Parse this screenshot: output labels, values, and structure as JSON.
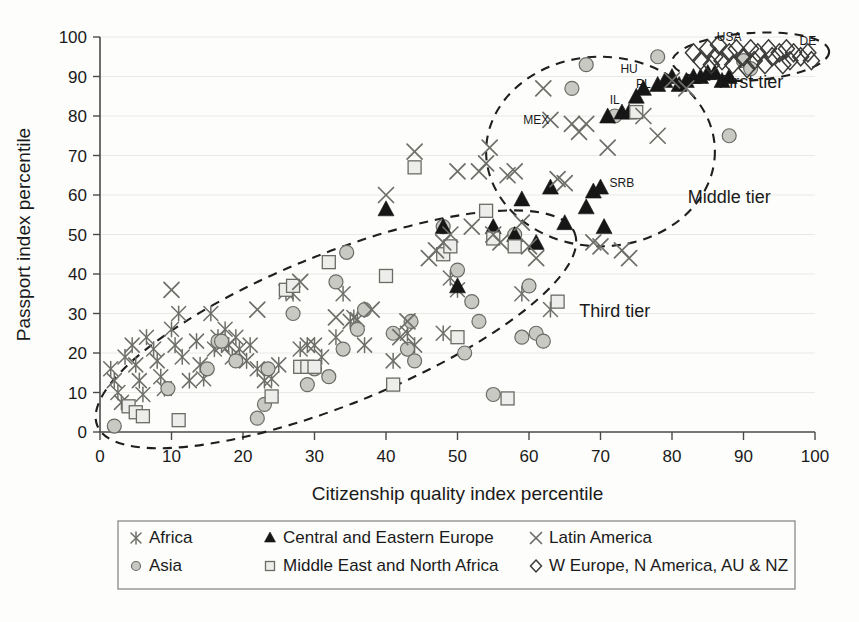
{
  "chart_data": {
    "type": "scatter",
    "title": "",
    "xlabel": "Citizenship quality index percentile",
    "ylabel": "Passport index percentile",
    "xlim": [
      0,
      100
    ],
    "ylim": [
      0,
      100
    ],
    "xticks": [
      0,
      10,
      20,
      30,
      40,
      50,
      60,
      70,
      80,
      90,
      100
    ],
    "yticks": [
      0,
      10,
      20,
      30,
      40,
      50,
      60,
      70,
      80,
      90,
      100
    ],
    "grid": "horizontal",
    "legend_position": "below-plot",
    "series": [
      {
        "name": "Africa",
        "marker": "asterisk",
        "color": "#6e6e6a",
        "points": [
          [
            1.5,
            16
          ],
          [
            2,
            13
          ],
          [
            2.5,
            10
          ],
          [
            3,
            7.5
          ],
          [
            3.5,
            19
          ],
          [
            4.5,
            22
          ],
          [
            5,
            17
          ],
          [
            5.5,
            13
          ],
          [
            6,
            9.5
          ],
          [
            6.5,
            24
          ],
          [
            7.5,
            21
          ],
          [
            8,
            18
          ],
          [
            8.5,
            14
          ],
          [
            9,
            11
          ],
          [
            10,
            26
          ],
          [
            10.5,
            22
          ],
          [
            11,
            30
          ],
          [
            11.5,
            19
          ],
          [
            12.5,
            13
          ],
          [
            13.5,
            23
          ],
          [
            14,
            17
          ],
          [
            14.5,
            13.5
          ],
          [
            15.5,
            30
          ],
          [
            16,
            21
          ],
          [
            16.5,
            24
          ],
          [
            17,
            22
          ],
          [
            17.5,
            26
          ],
          [
            18,
            22
          ],
          [
            18.5,
            19
          ],
          [
            19,
            24
          ],
          [
            19.5,
            21
          ],
          [
            20.5,
            18
          ],
          [
            21,
            22
          ],
          [
            22,
            16
          ],
          [
            23,
            13
          ],
          [
            24,
            13.5
          ],
          [
            25,
            17
          ],
          [
            26,
            35.5
          ],
          [
            27,
            35
          ],
          [
            28,
            21
          ],
          [
            29,
            22
          ],
          [
            30,
            22
          ],
          [
            31,
            19
          ],
          [
            33,
            24
          ],
          [
            34,
            35
          ],
          [
            35,
            28
          ],
          [
            35.5,
            29
          ],
          [
            36,
            28.5
          ],
          [
            37,
            22
          ],
          [
            41,
            18
          ],
          [
            43,
            25
          ],
          [
            44,
            22
          ],
          [
            48,
            25
          ],
          [
            49,
            39
          ],
          [
            50,
            36
          ],
          [
            59,
            35
          ],
          [
            63,
            31
          ]
        ]
      },
      {
        "name": "Asia",
        "marker": "circle",
        "color": "#c9c9c4",
        "points": [
          [
            2,
            1.5
          ],
          [
            9.5,
            11
          ],
          [
            15,
            16
          ],
          [
            16.5,
            23
          ],
          [
            17,
            23
          ],
          [
            19,
            18
          ],
          [
            22,
            3.5
          ],
          [
            23,
            7
          ],
          [
            23.5,
            16
          ],
          [
            27,
            30
          ],
          [
            29,
            12
          ],
          [
            30,
            16
          ],
          [
            32,
            14
          ],
          [
            33,
            38
          ],
          [
            34,
            21
          ],
          [
            34.5,
            45.5
          ],
          [
            36,
            26
          ],
          [
            37,
            31
          ],
          [
            41,
            25
          ],
          [
            43,
            21
          ],
          [
            43.5,
            28
          ],
          [
            44,
            18
          ],
          [
            48,
            52
          ],
          [
            50,
            41
          ],
          [
            51,
            20
          ],
          [
            52,
            33
          ],
          [
            53,
            28
          ],
          [
            55,
            9.5
          ],
          [
            58,
            50
          ],
          [
            59,
            24
          ],
          [
            60,
            37
          ],
          [
            61,
            25
          ],
          [
            62,
            23
          ],
          [
            66,
            87
          ],
          [
            68,
            93
          ],
          [
            72,
            80
          ],
          [
            78,
            95
          ],
          [
            88,
            75
          ],
          [
            90,
            94
          ],
          [
            91,
            92
          ]
        ]
      },
      {
        "name": "Central and Eastern Europe",
        "marker": "triangle",
        "color": "#161616",
        "points": [
          [
            40,
            56.5
          ],
          [
            48,
            52
          ],
          [
            50,
            37
          ],
          [
            55,
            52
          ],
          [
            58,
            50
          ],
          [
            59,
            59
          ],
          [
            61,
            48
          ],
          [
            63,
            62
          ],
          [
            65,
            53
          ],
          [
            68,
            57
          ],
          [
            69,
            61
          ],
          [
            70,
            62
          ],
          [
            70.5,
            52
          ],
          [
            71,
            80
          ],
          [
            73,
            81
          ],
          [
            74,
            81
          ],
          [
            75,
            85
          ],
          [
            76,
            87
          ],
          [
            78,
            88
          ],
          [
            79,
            89
          ],
          [
            80,
            90
          ],
          [
            81,
            88
          ],
          [
            82,
            89
          ],
          [
            83,
            90
          ],
          [
            84,
            90
          ],
          [
            85,
            91
          ],
          [
            86,
            91
          ],
          [
            87,
            89
          ],
          [
            88,
            90
          ]
        ]
      },
      {
        "name": "Middle East and North Africa",
        "marker": "square",
        "color": "#ededeb",
        "points": [
          [
            4,
            6.5
          ],
          [
            5,
            5
          ],
          [
            6,
            4
          ],
          [
            11,
            3
          ],
          [
            24,
            9
          ],
          [
            26,
            36
          ],
          [
            27,
            37
          ],
          [
            28,
            16.5
          ],
          [
            29,
            16.5
          ],
          [
            30,
            16.5
          ],
          [
            32,
            43
          ],
          [
            40,
            39.5
          ],
          [
            41,
            12
          ],
          [
            44,
            67
          ],
          [
            48,
            45
          ],
          [
            49,
            47
          ],
          [
            50,
            24
          ],
          [
            54,
            56
          ],
          [
            55,
            49
          ],
          [
            57,
            8.5
          ],
          [
            58,
            47
          ],
          [
            64,
            33
          ],
          [
            75,
            81
          ]
        ]
      },
      {
        "name": "Latin America",
        "marker": "x",
        "color": "#6e6e6a",
        "points": [
          [
            10,
            36
          ],
          [
            22,
            31
          ],
          [
            28,
            38
          ],
          [
            33,
            29
          ],
          [
            38,
            31
          ],
          [
            40,
            60
          ],
          [
            42,
            24
          ],
          [
            43,
            28
          ],
          [
            44,
            71
          ],
          [
            46,
            44
          ],
          [
            47,
            46
          ],
          [
            48,
            48
          ],
          [
            49,
            50
          ],
          [
            50,
            66
          ],
          [
            52,
            52
          ],
          [
            53,
            66
          ],
          [
            54,
            68
          ],
          [
            54.5,
            72
          ],
          [
            55,
            50
          ],
          [
            56,
            48
          ],
          [
            57,
            65
          ],
          [
            58,
            66
          ],
          [
            59,
            53
          ],
          [
            60,
            47
          ],
          [
            61,
            44
          ],
          [
            62,
            87
          ],
          [
            63,
            79
          ],
          [
            64,
            64
          ],
          [
            65,
            63
          ],
          [
            66,
            78
          ],
          [
            67,
            76
          ],
          [
            68,
            78
          ],
          [
            69,
            48
          ],
          [
            70,
            47
          ],
          [
            71,
            72
          ],
          [
            73,
            46
          ],
          [
            74,
            44
          ],
          [
            76,
            80
          ],
          [
            78,
            75
          ],
          [
            80,
            89
          ],
          [
            82,
            87
          ]
        ]
      },
      {
        "name": "W Europe, N America, AU & NZ",
        "marker": "diamond",
        "color": "#3a3a38",
        "points": [
          [
            83,
            96
          ],
          [
            84,
            94
          ],
          [
            85,
            97
          ],
          [
            85.5,
            93
          ],
          [
            86,
            95
          ],
          [
            86.5,
            98
          ],
          [
            87,
            94
          ],
          [
            88,
            96
          ],
          [
            88.5,
            93
          ],
          [
            89,
            97
          ],
          [
            90,
            95
          ],
          [
            90.5,
            92
          ],
          [
            91,
            97
          ],
          [
            91.5,
            94
          ],
          [
            92,
            96
          ],
          [
            93,
            93
          ],
          [
            93.5,
            97
          ],
          [
            94,
            95
          ],
          [
            95,
            96
          ],
          [
            95.5,
            93
          ],
          [
            96,
            97
          ],
          [
            96.5,
            94
          ],
          [
            97,
            96
          ],
          [
            98,
            95
          ],
          [
            99,
            96
          ],
          [
            99.5,
            94
          ]
        ]
      }
    ],
    "point_labels": [
      {
        "text": "USA",
        "x": 88,
        "y": 99
      },
      {
        "text": "DE",
        "x": 99,
        "y": 98
      },
      {
        "text": "HU",
        "x": 74,
        "y": 91
      },
      {
        "text": "PL",
        "x": 76,
        "y": 87
      },
      {
        "text": "IL",
        "x": 72,
        "y": 83
      },
      {
        "text": "MEX",
        "x": 61,
        "y": 78
      },
      {
        "text": "SRB",
        "x": 73,
        "y": 62
      }
    ],
    "annotations": [
      {
        "text": "First tier",
        "x": 91,
        "y": 87
      },
      {
        "text": "Middle tier",
        "x": 88,
        "y": 58
      },
      {
        "text": "Third tier",
        "x": 72,
        "y": 29
      }
    ],
    "clusters": [
      {
        "name": "first-tier-ellipse",
        "cx": 91,
        "cy": 95,
        "rx": 11,
        "ry": 6,
        "rotate": -4
      },
      {
        "name": "middle-tier-ellipse",
        "cx": 70,
        "cy": 71,
        "rx": 16,
        "ry": 24,
        "rotate": 0
      },
      {
        "name": "third-tier-ellipse",
        "cx": 33,
        "cy": 26,
        "rx": 36,
        "ry": 19,
        "rotate": -22
      }
    ]
  },
  "legend": {
    "entries": [
      {
        "label": "Africa",
        "marker": "asterisk"
      },
      {
        "label": "Asia",
        "marker": "circle"
      },
      {
        "label": "Central and Eastern Europe",
        "marker": "triangle"
      },
      {
        "label": "Middle East and North Africa",
        "marker": "square"
      },
      {
        "label": "Latin America",
        "marker": "x"
      },
      {
        "label": "W Europe, N America, AU & NZ",
        "marker": "diamond"
      }
    ]
  },
  "colors": {
    "background": "#fdfdfb",
    "axis": "#4a4a48",
    "gridline": "#e9e9e6",
    "ellipse": "#1f1f1f",
    "text": "#1a1a1a"
  }
}
